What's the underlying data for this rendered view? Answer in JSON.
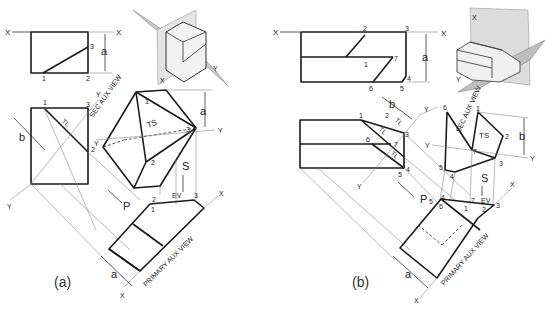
{
  "figure": {
    "panels": [
      {
        "id": "a",
        "caption": "(a)",
        "front_view": {
          "axis_left": "X",
          "axis_right": "X",
          "points": [
            "1",
            "2",
            "3"
          ],
          "dimension": "a"
        },
        "side_view": {
          "points": [
            "1",
            "3",
            "2"
          ],
          "true_length": "TL",
          "dimension": "b",
          "axis_bottom": "Y",
          "axis_top": "Y"
        },
        "secondary_aux_view": {
          "label": "SEC AUX VIEW",
          "true_shape": "TS",
          "points": [
            "1",
            "2",
            "3"
          ],
          "axis_left": "Y",
          "axis_right": "Y",
          "dimension": "a"
        },
        "primary_aux_view": {
          "label": "PRIMARY AUX VIEW",
          "edge_view": "EV",
          "points": [
            "1",
            "2",
            "3"
          ],
          "axis_top": "X",
          "axis_bottom": "X",
          "dimension": "a",
          "sight_direction": "S",
          "direction_arrow": "P"
        },
        "pictorial": {
          "axis_labels": [
            "X",
            "Y"
          ]
        }
      },
      {
        "id": "b",
        "caption": "(b)",
        "front_view": {
          "axis_left": "X",
          "axis_right": "X",
          "points": [
            "1",
            "2",
            "3",
            "4",
            "5",
            "6",
            "7"
          ],
          "dimension": "a"
        },
        "side_view": {
          "points": [
            "1",
            "2",
            "3",
            "4",
            "5",
            "6",
            "7"
          ],
          "true_length_labels": [
            "TL",
            "TL",
            "TL"
          ],
          "dimension": "b",
          "axis_top": "Y",
          "axis_bottom": "Y"
        },
        "secondary_aux_view": {
          "label": "SEC AUX VIEW",
          "true_shape": "TS",
          "points": [
            "1",
            "2",
            "3",
            "4",
            "5",
            "6",
            "7"
          ],
          "axis_left": "Y",
          "axis_right": "Y",
          "dimension": "b"
        },
        "primary_aux_view": {
          "label": "PRIMARY AUX VIEW",
          "edge_view": "EV",
          "points": [
            "1",
            "2",
            "3",
            "4",
            "5",
            "6",
            "7"
          ],
          "axis_top": "X",
          "axis_bottom": "X",
          "dimension": "a",
          "sight_direction": "S",
          "direction_arrow": "P"
        },
        "pictorial": {
          "axis_labels": [
            "X",
            "Y"
          ]
        }
      }
    ]
  }
}
